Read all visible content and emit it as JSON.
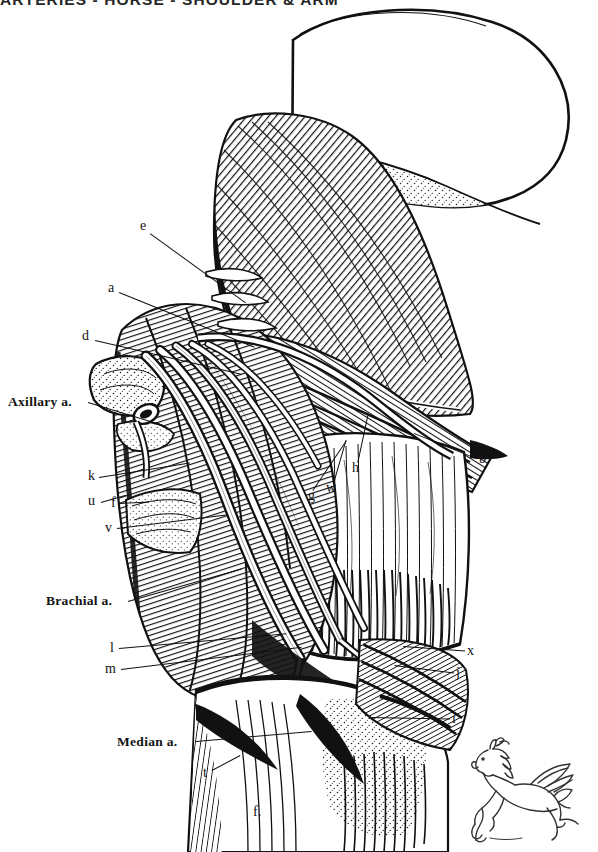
{
  "plate": {
    "title": "ARTERIES - HORSE - SHOULDER & ARM",
    "subject": "horse",
    "region": "shoulder and arm",
    "style": "line-engraving anatomical plate",
    "background_color": "#ffffff",
    "ink_color": "#101010"
  },
  "named_labels": [
    {
      "id": "axillary-a",
      "text": "Axillary a.",
      "x": 8,
      "y": 395,
      "leader_len": 78,
      "leader_angle": 17
    },
    {
      "id": "brachial-a",
      "text": "Brachial a.",
      "x": 46,
      "y": 594,
      "leader_len": 106,
      "leader_angle": -16
    },
    {
      "id": "median-a",
      "text": "Median a.",
      "x": 117,
      "y": 735,
      "leader_len": 96,
      "leader_angle": -4
    }
  ],
  "letter_labels": [
    {
      "id": "e",
      "text": "e",
      "x": 140,
      "y": 219,
      "leader_len": 110,
      "leader_angle": 36
    },
    {
      "id": "a",
      "text": "a",
      "x": 108,
      "y": 281,
      "leader_len": 116,
      "leader_angle": 24
    },
    {
      "id": "d",
      "text": "d",
      "x": 82,
      "y": 329,
      "leader_len": 142,
      "leader_angle": 14
    },
    {
      "id": "k",
      "text": "k",
      "x": 88,
      "y": 469,
      "leader_len": 84,
      "leader_angle": -9
    },
    {
      "id": "u",
      "text": "u",
      "x": 88,
      "y": 494,
      "leader_len": 62,
      "leader_angle": -12
    },
    {
      "id": "f",
      "text": "f",
      "x": 111,
      "y": 496,
      "leader_len": 32,
      "leader_angle": -2
    },
    {
      "id": "v",
      "text": "v",
      "x": 105,
      "y": 521,
      "leader_len": 108,
      "leader_angle": -7
    },
    {
      "id": "l",
      "text": "l",
      "x": 110,
      "y": 641,
      "leader_len": 166,
      "leader_angle": -5
    },
    {
      "id": "m",
      "text": "m",
      "x": 105,
      "y": 662,
      "leader_len": 178,
      "leader_angle": -7
    },
    {
      "id": "t",
      "text": "t",
      "x": 203,
      "y": 766,
      "leader_len": 30,
      "leader_angle": -26
    },
    {
      "id": "g",
      "text": "g",
      "x": 308,
      "y": 489,
      "leader_len": 58,
      "leader_angle": -52
    },
    {
      "id": "w",
      "text": "w",
      "x": 326,
      "y": 481,
      "leader_len": 44,
      "leader_angle": -70
    },
    {
      "id": "h",
      "text": "h",
      "x": 352,
      "y": 461,
      "leader_len": 48,
      "leader_angle": -74
    },
    {
      "id": "b",
      "text": "b",
      "x": 479,
      "y": 452,
      "leader_len": 66,
      "leader_angle": 200
    },
    {
      "id": "x",
      "text": "x",
      "x": 467,
      "y": 644,
      "leader_len": 60,
      "leader_angle": 184
    },
    {
      "id": "j",
      "text": "j",
      "x": 456,
      "y": 666,
      "leader_len": 58,
      "leader_angle": 186
    },
    {
      "id": "i",
      "text": "i",
      "x": 452,
      "y": 712,
      "leader_len": 76,
      "leader_angle": 182
    },
    {
      "id": "f-lower",
      "text": "f.",
      "x": 253,
      "y": 805,
      "leader_len": 0,
      "leader_angle": 0
    }
  ],
  "logo": {
    "id": "pegasus-logo",
    "name": "winged-horse-logo",
    "description": "Leaping winged horse (pegasus) publisher mark"
  }
}
